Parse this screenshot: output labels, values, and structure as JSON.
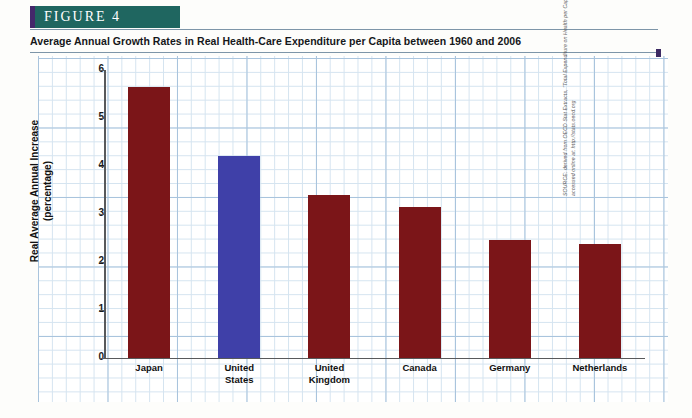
{
  "figure": {
    "banner_label": "FIGURE  4",
    "title": "Average Annual Growth Rates in Real Health-Care Expenditure per Capita between 1960 and 2006",
    "source": "SOURCE: derived from OECD Stat Extracts, \"Total Expenditure on Health per Capita,\" accessed online at: http://stats.oecd.org",
    "banner_bg": "#1f6660",
    "banner_accent": "#44286b",
    "rule_color": "#7d95a8"
  },
  "chart_data": {
    "type": "bar",
    "title": "Average Annual Growth Rates in Real Health-Care Expenditure per Capita between 1960 and 2006",
    "categories": [
      "Japan",
      "United\nStates",
      "United\nKingdom",
      "Canada",
      "Germany",
      "Netherlands"
    ],
    "values": [
      5.65,
      4.2,
      3.4,
      3.15,
      2.45,
      2.38
    ],
    "colors": [
      "#7b1518",
      "#3f40a8",
      "#7b1518",
      "#7b1518",
      "#7b1518",
      "#7b1518"
    ],
    "xlabel": "",
    "ylabel": "Real Average Annual Increase\n(percentage)",
    "ylim": [
      0,
      6
    ],
    "yticks": [
      0,
      1,
      2,
      3,
      4,
      5,
      6
    ],
    "ytick_labels": [
      "0",
      "1",
      "2",
      "3",
      "4",
      "5",
      "6"
    ],
    "grid": true,
    "legend": false,
    "highlight_category": "United\nStates",
    "highlight_color": "#3f40a8",
    "bar_color": "#7b1518"
  }
}
